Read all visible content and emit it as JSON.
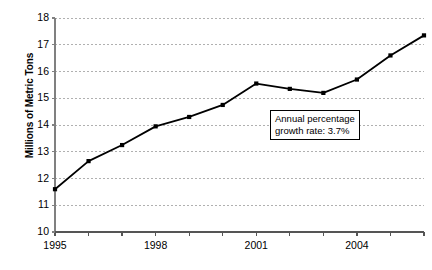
{
  "chart_data": {
    "type": "line",
    "title": "",
    "xlabel": "",
    "ylabel": "Millions of Metric Tons",
    "x": [
      1995,
      1996,
      1997,
      1998,
      1999,
      2000,
      2001,
      2002,
      2003,
      2004,
      2005,
      2006
    ],
    "values": [
      11.6,
      12.65,
      13.25,
      13.95,
      14.3,
      14.75,
      15.55,
      15.35,
      15.2,
      15.7,
      16.6,
      17.35
    ],
    "series": [
      {
        "name": "Consumption",
        "values": [
          11.6,
          12.65,
          13.25,
          13.95,
          14.3,
          14.75,
          15.55,
          15.35,
          15.2,
          15.7,
          16.6,
          17.35
        ]
      }
    ],
    "xlim": [
      1995,
      2006
    ],
    "ylim": [
      10,
      18
    ],
    "ytick_labels": [
      "10",
      "11",
      "12",
      "13",
      "14",
      "15",
      "16",
      "17",
      "18"
    ],
    "ytick_values": [
      10,
      11,
      12,
      13,
      14,
      15,
      16,
      17,
      18
    ],
    "xtick_values": [
      1995,
      1996,
      1997,
      1998,
      1999,
      2000,
      2001,
      2002,
      2003,
      2004,
      2005,
      2006
    ],
    "xtick_labels_shown": [
      "1995",
      "1998",
      "2001",
      "2004"
    ],
    "xtick_labeled_values": [
      1995,
      1998,
      2001,
      2004
    ],
    "grid": "horizontal-dotted",
    "legend": "none",
    "line_color": "#000000",
    "marker": "square",
    "marker_color": "#000000",
    "gridline_color": "#b0b0b0",
    "axis_color": "#808080",
    "annotations": [
      {
        "name": "growth-rate-note",
        "line1": "Annual percentage",
        "line2": "growth rate: 3.7%",
        "x": 2002.3,
        "y": 14.1
      }
    ]
  }
}
